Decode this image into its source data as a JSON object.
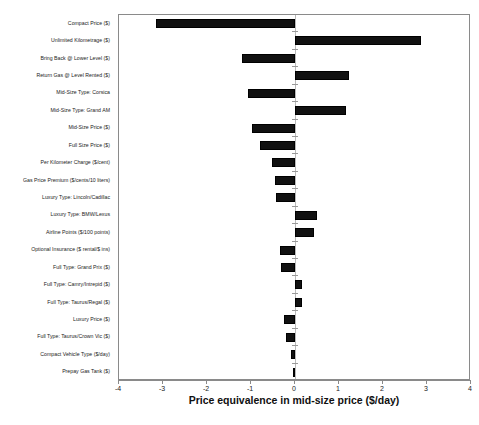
{
  "chart_data": {
    "type": "bar",
    "orientation": "horizontal",
    "title": "",
    "xlabel": "Price equivalence in mid-size price ($/day)",
    "ylabel": "",
    "xlim": [
      -4,
      4
    ],
    "xticks": [
      "-4",
      "-3",
      "-2",
      "-1",
      "0",
      "1",
      "2",
      "3",
      "4"
    ],
    "xtick_values": [
      -4,
      -3,
      -2,
      -1,
      0,
      1,
      2,
      3,
      4
    ],
    "grid": false,
    "legend": "none",
    "zero_reference_line": true,
    "categories": [
      "Compact Price ($)",
      "Unlimited Kilometrage ($)",
      "Bring Back @ Lower Level ($)",
      "Return Gas @ Level Rented ($)",
      "Mid-Size Type: Corsica",
      "Mid-Size Type: Grand AM",
      "Mid-Size Price ($)",
      "Full Size Price ($)",
      "Per Kilometer Charge ($/cent)",
      "Gas Price Premium ($/cents/10 liters)",
      "Luxury Type: Lincoln/Cadillac",
      "Luxury Type: BMW/Lexus",
      "Airline Points ($/100 points)",
      "Optional Insurance ($ rental/$ ins)",
      "Full Type: Grand Prix ($)",
      "Full Type: Camry/Intrepid ($)",
      "Full Type: Taurus/Regal ($)",
      "Luxury Price ($)",
      "Full Type: Taurus/Crown Vic ($)",
      "Compact Vehicle Type ($/day)",
      "Prepay Gas Tank ($)"
    ],
    "values": [
      -3.16,
      2.86,
      -1.2,
      1.23,
      -1.07,
      1.16,
      -0.98,
      -0.8,
      -0.52,
      -0.45,
      -0.43,
      0.5,
      0.43,
      -0.34,
      -0.32,
      0.16,
      0.16,
      -0.25,
      -0.2,
      -0.09,
      -0.03
    ],
    "bar_color": "#111111"
  },
  "caption": {
    "text": ""
  }
}
